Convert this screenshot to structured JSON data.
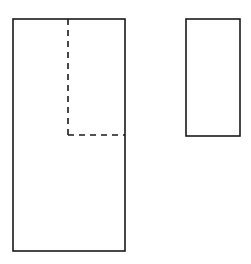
{
  "figure": {
    "canvas": {
      "width": 251,
      "height": 264,
      "background_color": "#ffffff"
    },
    "style": {
      "stroke_color": "#1a1a1a",
      "solid_stroke_width": 1.6,
      "dashed_stroke_width": 1.6,
      "dash_pattern": "6 5",
      "fill": "none"
    },
    "shapes": [
      {
        "name": "large-rectangle",
        "kind": "rectangle",
        "x": 13,
        "y": 19,
        "width": 112,
        "height": 232,
        "line_style": "solid"
      },
      {
        "name": "small-rectangle",
        "kind": "rectangle",
        "x": 186,
        "y": 19,
        "width": 54,
        "height": 117,
        "line_style": "solid"
      },
      {
        "name": "dashed-vertical-divider",
        "kind": "line",
        "x1": 68,
        "y1": 19,
        "x2": 68,
        "y2": 135,
        "line_style": "dashed"
      },
      {
        "name": "dashed-horizontal-divider",
        "kind": "line",
        "x1": 68,
        "y1": 135,
        "x2": 125,
        "y2": 135,
        "line_style": "dashed"
      }
    ]
  }
}
